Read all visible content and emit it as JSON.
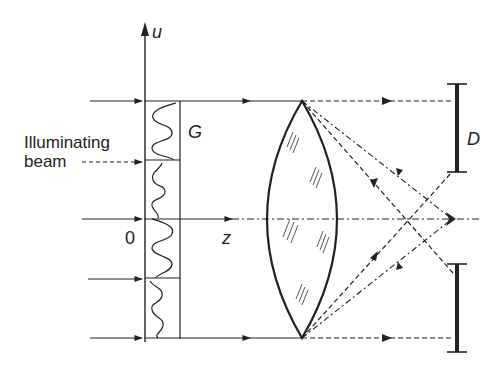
{
  "figure": {
    "type": "optical schematic"
  },
  "labels": {
    "u_axis": "u",
    "z_axis": "z",
    "origin": "0",
    "grating": "G",
    "beam_line1": "Illuminating",
    "beam_line2": "beam",
    "detector": "D"
  },
  "colors": {
    "ink": "#222222",
    "background": "#ffffff"
  },
  "elements": {
    "incident_rays": 5,
    "grating_cells": 4,
    "lens_type": "biconvex",
    "detector_parts": [
      "upper-aperture-bar",
      "lower-aperture-bar"
    ]
  }
}
